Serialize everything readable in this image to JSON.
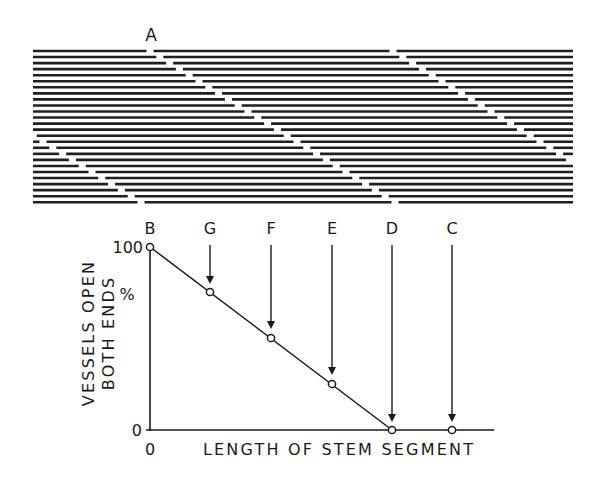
{
  "figure": {
    "top_label": "A",
    "vessel_panel": {
      "line_count": 26,
      "x_start": 33,
      "x_end": 573,
      "y_start": 51,
      "spacing": 6.05,
      "line_color": "#1f1f1f",
      "bands": [
        {
          "name": "band-A",
          "x0": 150,
          "slope": 9.8,
          "gap": 7
        },
        {
          "name": "band-2",
          "x0": 393,
          "slope": 9.8,
          "gap": 7
        },
        {
          "name": "band-3",
          "x0": -104,
          "slope": 9.8,
          "gap": 7
        }
      ]
    },
    "plot": {
      "point_labels": [
        "B",
        "G",
        "F",
        "E",
        "D",
        "C"
      ],
      "y_tick_top": "100",
      "y_tick_bottom": "0",
      "x_tick_origin": "0",
      "percent_sign": "%",
      "ylabel_line1": "VESSELS OPEN",
      "ylabel_line2": "BOTH ENDS",
      "xlabel": "LENGTH OF STEM SEGMENT"
    }
  },
  "chart_data": {
    "type": "line",
    "title": "",
    "xlabel": "LENGTH OF STEM SEGMENT",
    "ylabel": "VESSELS OPEN BOTH ENDS %",
    "categories": [
      "B",
      "G",
      "F",
      "E",
      "D",
      "C"
    ],
    "x": [
      0,
      1,
      2,
      3,
      4,
      5
    ],
    "values": [
      100,
      75,
      50,
      25,
      0,
      0
    ],
    "ylim": [
      0,
      100
    ],
    "y_ticks": [
      "0",
      "100"
    ],
    "x_ticks": [
      "0"
    ],
    "annotations": [
      {
        "label": "B",
        "x": 0,
        "y": 100,
        "arrow": false
      },
      {
        "label": "G",
        "x": 1,
        "y": 75,
        "arrow": true
      },
      {
        "label": "F",
        "x": 2,
        "y": 50,
        "arrow": true
      },
      {
        "label": "E",
        "x": 3,
        "y": 25,
        "arrow": true
      },
      {
        "label": "D",
        "x": 4,
        "y": 0,
        "arrow": true
      },
      {
        "label": "C",
        "x": 5,
        "y": 0,
        "arrow": true
      }
    ],
    "grid": false,
    "legend": null
  }
}
